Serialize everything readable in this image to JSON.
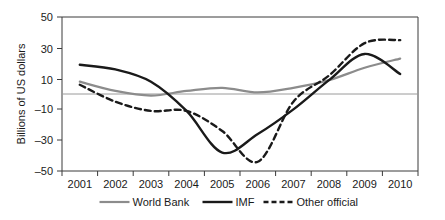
{
  "chart_data": {
    "type": "line",
    "title": "",
    "xlabel": "",
    "ylabel": "Billions of US dollars",
    "xlim": [
      2000.5,
      2010.5
    ],
    "ylim": [
      -50,
      50
    ],
    "grid": false,
    "zero_line": true,
    "legend_position": "bottom",
    "x": [
      2001,
      2002,
      2003,
      2004,
      2005,
      2006,
      2007,
      2008,
      2009,
      2010
    ],
    "xticklabels": [
      "2001",
      "2002",
      "2003",
      "2004",
      "2005",
      "2006",
      "2007",
      "2008",
      "2009",
      "2010"
    ],
    "yticks": [
      -50,
      -30,
      -10,
      10,
      30,
      50
    ],
    "yticklabels": [
      "–50",
      "–30",
      "–10",
      "10",
      "30",
      "50"
    ],
    "series": [
      {
        "name": "World Bank",
        "color": "#8c8c8c",
        "style": "solid",
        "width": 2.2,
        "values": [
          8,
          2,
          -1,
          2,
          4,
          1,
          4,
          9,
          17,
          23
        ]
      },
      {
        "name": "IMF",
        "color": "#1a1a1a",
        "style": "solid",
        "width": 2.4,
        "values": [
          19,
          16,
          8,
          -11,
          -38,
          -26,
          -10,
          9,
          26,
          13
        ]
      },
      {
        "name": "Other official",
        "color": "#1a1a1a",
        "style": "dashed",
        "width": 2.4,
        "values": [
          6,
          -5,
          -11,
          -11,
          -24,
          -44,
          -5,
          12,
          33,
          35
        ]
      }
    ]
  },
  "legend": {
    "items": [
      {
        "label": "World Bank"
      },
      {
        "label": "IMF"
      },
      {
        "label": "Other official"
      }
    ]
  },
  "axes": {
    "y_title": "Billions of US dollars",
    "y_tick_labels": [
      "50",
      "30",
      "10",
      "–10",
      "–30",
      "–50"
    ],
    "x_tick_labels": [
      "2001",
      "2002",
      "2003",
      "2004",
      "2005",
      "2006",
      "2007",
      "2008",
      "2009",
      "2010"
    ]
  },
  "colors": {
    "world_bank": "#8c8c8c",
    "imf": "#1a1a1a",
    "other_official": "#1a1a1a",
    "frame": "#3a3a3a",
    "zero_line": "#9a9a9a",
    "background": "#ffffff"
  }
}
